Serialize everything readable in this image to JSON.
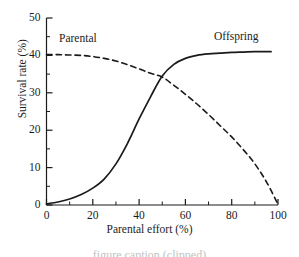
{
  "figure": {
    "background_color": "#ffffff",
    "line_color": "#1a1a1a",
    "caption_partial": "figure caption (clipped)"
  },
  "chart_data": {
    "type": "line",
    "title": "",
    "xlabel": "Parental effort (%)",
    "ylabel": "Survival rate (%)",
    "xlim": [
      0,
      100
    ],
    "ylim": [
      0,
      50
    ],
    "x_major_ticks": [
      0,
      20,
      40,
      60,
      80,
      100
    ],
    "x_minor_ticks": [
      10,
      30,
      50,
      70,
      90
    ],
    "y_major_ticks": [
      0,
      10,
      20,
      30,
      40,
      50
    ],
    "y_minor_ticks": [
      5,
      15,
      25,
      35,
      45
    ],
    "x_tick_labels": [
      "0",
      "20",
      "40",
      "60",
      "80",
      "100"
    ],
    "y_tick_labels": [
      "0",
      "10",
      "20",
      "30",
      "40",
      "50"
    ],
    "grid": false,
    "legend_position": "inline-annotations",
    "annotations": [
      {
        "text": "Parental",
        "x": 24,
        "y": 44
      },
      {
        "text": "Offspring",
        "x": 84,
        "y": 45
      }
    ],
    "series": [
      {
        "name": "Offspring",
        "style": "solid",
        "x": [
          0,
          5,
          10,
          15,
          20,
          25,
          30,
          35,
          40,
          45,
          50,
          55,
          60,
          65,
          70,
          75,
          80,
          85,
          90,
          95,
          97
        ],
        "values": [
          0.3,
          0.8,
          1.6,
          2.8,
          4.5,
          7.0,
          11.0,
          16.5,
          23.0,
          29.0,
          34.5,
          37.6,
          39.2,
          40.0,
          40.4,
          40.6,
          40.8,
          40.9,
          41.0,
          41.0,
          41.0
        ]
      },
      {
        "name": "Parental",
        "style": "dashed",
        "x": [
          0,
          5,
          10,
          15,
          20,
          25,
          30,
          35,
          40,
          45,
          50,
          55,
          60,
          65,
          70,
          75,
          80,
          85,
          90,
          95,
          100
        ],
        "values": [
          40.2,
          40.2,
          40.1,
          40.0,
          39.7,
          39.2,
          38.5,
          37.5,
          36.4,
          35.2,
          34.2,
          32.0,
          29.6,
          27.0,
          24.2,
          21.2,
          18.2,
          14.8,
          11.0,
          6.2,
          0.2
        ]
      }
    ]
  }
}
